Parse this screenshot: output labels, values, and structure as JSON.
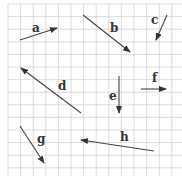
{
  "diagram": {
    "grid": {
      "x0": 8,
      "y0": 4,
      "cell": 12.6,
      "cols": 14,
      "rows": 14,
      "color": "#d4d4d4"
    },
    "arrow_color": "#444444",
    "vectors": [
      {
        "label": "a",
        "x1": 20,
        "y1": 40,
        "x2": 57,
        "y2": 28,
        "lx": 32,
        "ly": 32
      },
      {
        "label": "b",
        "x1": 83,
        "y1": 15,
        "x2": 130,
        "y2": 52,
        "lx": 110,
        "ly": 32
      },
      {
        "label": "c",
        "x1": 167,
        "y1": 15,
        "x2": 156,
        "y2": 40,
        "lx": 151,
        "ly": 24
      },
      {
        "label": "d",
        "x1": 81,
        "y1": 113,
        "x2": 21,
        "y2": 68,
        "lx": 58,
        "ly": 90
      },
      {
        "label": "e",
        "x1": 119,
        "y1": 76,
        "x2": 119,
        "y2": 113,
        "lx": 109,
        "ly": 100
      },
      {
        "label": "f",
        "x1": 141,
        "y1": 89,
        "x2": 166,
        "y2": 89,
        "lx": 152,
        "ly": 82
      },
      {
        "label": "g",
        "x1": 20,
        "y1": 126,
        "x2": 44,
        "y2": 163,
        "lx": 37,
        "ly": 143
      },
      {
        "label": "h",
        "x1": 154,
        "y1": 151,
        "x2": 81,
        "y2": 140,
        "lx": 120,
        "ly": 141
      }
    ]
  }
}
